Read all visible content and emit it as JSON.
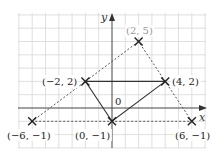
{
  "diagram": {
    "type": "coordinate-grid",
    "axes": {
      "x_label": "x",
      "y_label": "y",
      "origin_label": "0"
    },
    "grid": {
      "x_range": [
        -7,
        7
      ],
      "y_range": [
        -3,
        7
      ],
      "step": 1
    },
    "colors": {
      "grid": "#d8d8d8",
      "axis": "#444444",
      "solid": "#333333",
      "dashed": "#555555",
      "grey_label": "#999999"
    },
    "points": [
      {
        "label": "(2, 5)",
        "x": 2,
        "y": 5
      },
      {
        "label": "(−2, 2)",
        "x": -2,
        "y": 2
      },
      {
        "label": "(4, 2)",
        "x": 4,
        "y": 2
      },
      {
        "label": "(−6, −1)",
        "x": -6,
        "y": -1
      },
      {
        "label": "(0, −1)",
        "x": 0,
        "y": -1
      },
      {
        "label": "(6, −1)",
        "x": 6,
        "y": -1
      }
    ],
    "solid_triangle": [
      [
        -2,
        2
      ],
      [
        4,
        2
      ],
      [
        0,
        -1
      ]
    ],
    "dashed_triangle": [
      [
        2,
        5
      ],
      [
        -6,
        -1
      ],
      [
        6,
        -1
      ]
    ]
  }
}
